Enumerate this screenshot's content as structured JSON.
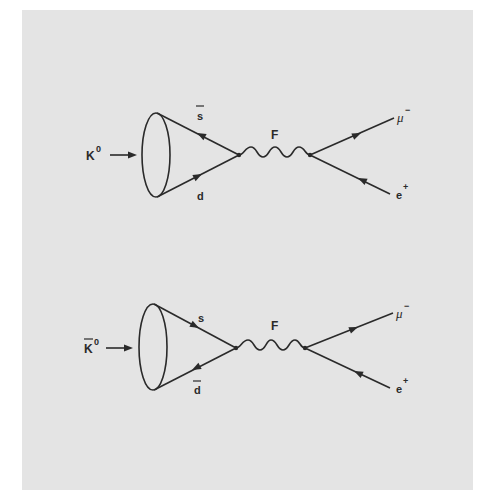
{
  "colors": {
    "panel": "#e4e4e4",
    "ink": "#2a2a2a",
    "background": "#ffffff"
  },
  "diagrams": [
    {
      "id": "k0",
      "meson": {
        "base": "K",
        "sup": "0",
        "bar": false
      },
      "quark_top": {
        "label": "s",
        "bar": true,
        "arrow": "away-from-vertex"
      },
      "quark_bottom": {
        "label": "d",
        "bar": false,
        "arrow": "toward-vertex"
      },
      "boson": "F",
      "lepton_top": {
        "base": "μ",
        "sup": "−",
        "arrow": "away-from-vertex"
      },
      "lepton_bottom": {
        "base": "e",
        "sup": "+",
        "arrow": "toward-vertex"
      }
    },
    {
      "id": "k0bar",
      "meson": {
        "base": "K",
        "sup": "0",
        "bar": true
      },
      "quark_top": {
        "label": "s",
        "bar": false,
        "arrow": "toward-vertex"
      },
      "quark_bottom": {
        "label": "d",
        "bar": true,
        "arrow": "away-from-vertex"
      },
      "boson": "F",
      "lepton_top": {
        "base": "μ",
        "sup": "−",
        "arrow": "away-from-vertex"
      },
      "lepton_bottom": {
        "base": "e",
        "sup": "+",
        "arrow": "toward-vertex"
      }
    }
  ]
}
